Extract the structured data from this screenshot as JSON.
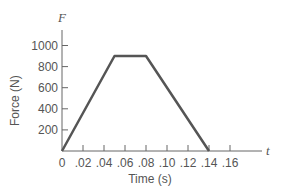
{
  "chart_data": {
    "type": "line",
    "title": "",
    "xlabel": "Time (s)",
    "ylabel": "Force (N)",
    "x_axis_variable": "t",
    "y_axis_variable": "F",
    "x_ticks": [
      "0",
      ".02",
      ".04",
      ".06",
      ".08",
      ".10",
      ".12",
      ".14",
      ".16"
    ],
    "y_ticks": [
      "200",
      "400",
      "600",
      "800",
      "1000"
    ],
    "xlim": [
      0,
      0.17
    ],
    "ylim": [
      0,
      1100
    ],
    "grid": false,
    "legend": null,
    "series": [
      {
        "name": "Force",
        "x": [
          0,
          0.05,
          0.08,
          0.14
        ],
        "y": [
          0,
          900,
          900,
          0
        ]
      }
    ]
  }
}
